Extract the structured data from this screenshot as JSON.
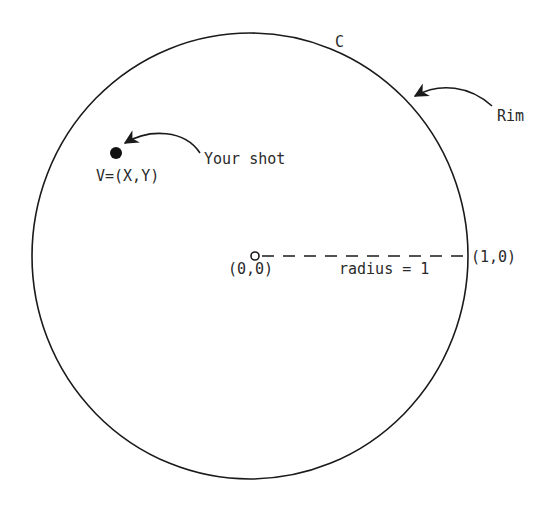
{
  "diagram": {
    "circle_label": "C",
    "rim_label": "Rim",
    "shot_label": "Your shot",
    "point_label": "V=(X,Y)",
    "center_label": "(0,0)",
    "edge_point_label": "(1,0)",
    "radius_label": "radius = 1",
    "colors": {
      "stroke": "#1a1a1a",
      "text": "#2a2a2a",
      "background": "#ffffff"
    }
  }
}
